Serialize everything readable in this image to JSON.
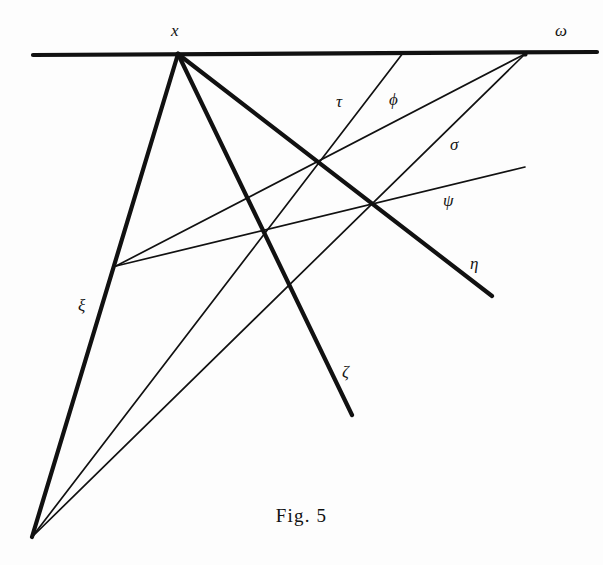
{
  "figure": {
    "caption": "Fig. 5",
    "ink_color": "#111111",
    "background_color": "#fdfdfd",
    "width": 603,
    "height": 565
  },
  "points": [
    {
      "id": "x",
      "label": "x",
      "x": 178,
      "y": 54,
      "label_x": 171,
      "label_y": 22
    },
    {
      "id": "omega",
      "label": "ω",
      "x": 525,
      "y": 54,
      "label_x": 555,
      "label_y": 22
    }
  ],
  "labels": [
    {
      "id": "tau",
      "text": "τ",
      "x": 336,
      "y": 93,
      "style": "italic"
    },
    {
      "id": "phi",
      "text": "ϕ",
      "x": 389,
      "y": 91,
      "style": "italic"
    },
    {
      "id": "sigma",
      "text": "σ",
      "x": 450,
      "y": 136,
      "style": "italic"
    },
    {
      "id": "psi",
      "text": "ψ",
      "x": 443,
      "y": 192,
      "style": "italic"
    },
    {
      "id": "eta",
      "text": "η",
      "x": 470,
      "y": 255,
      "style": "italic"
    },
    {
      "id": "zeta",
      "text": "ζ",
      "x": 342,
      "y": 363,
      "style": "italic"
    },
    {
      "id": "xi",
      "text": "ξ",
      "x": 78,
      "y": 297,
      "style": "italic"
    }
  ],
  "lines": [
    {
      "id": "horizontal-baseline",
      "name": "baseline",
      "x1": 33,
      "y1": 55,
      "x2": 597,
      "y2": 52,
      "weight": "thick"
    },
    {
      "id": "xi-line",
      "name": "ξ",
      "x1": 178,
      "y1": 54,
      "x2": 32,
      "y2": 537,
      "weight": "thick"
    },
    {
      "id": "zeta-line",
      "name": "ζ",
      "x1": 178,
      "y1": 54,
      "x2": 352,
      "y2": 415,
      "weight": "thick"
    },
    {
      "id": "eta-line",
      "name": "η",
      "x1": 178,
      "y1": 54,
      "x2": 492,
      "y2": 296,
      "weight": "thick"
    },
    {
      "id": "tau-line",
      "name": "τ",
      "x1": 403,
      "y1": 53,
      "x2": 32,
      "y2": 537,
      "weight": "thin"
    },
    {
      "id": "sigma-line",
      "name": "σ",
      "x1": 525,
      "y1": 54,
      "x2": 32,
      "y2": 537,
      "weight": "thin"
    },
    {
      "id": "phi-line",
      "name": "ϕ",
      "x1": 525,
      "y1": 54,
      "x2": 116,
      "y2": 266,
      "weight": "thin"
    },
    {
      "id": "psi-line",
      "name": "ψ",
      "x1": 525,
      "y1": 167,
      "x2": 116,
      "y2": 266,
      "weight": "thin"
    }
  ],
  "vertices": [
    {
      "id": "node-left-pencil",
      "x": 116,
      "y": 266
    },
    {
      "id": "node-upper-mid",
      "x": 317,
      "y": 159
    },
    {
      "id": "node-right-mid",
      "x": 374,
      "y": 202
    },
    {
      "id": "node-lower-mid",
      "x": 262,
      "y": 228
    },
    {
      "id": "node-bottom-apex",
      "x": 32,
      "y": 537
    }
  ]
}
